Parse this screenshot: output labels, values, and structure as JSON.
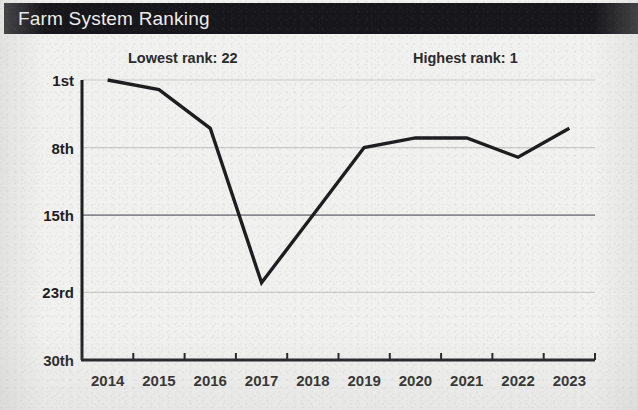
{
  "header": {
    "title": "Farm System Ranking",
    "bar_color": "#17161a",
    "title_color": "#f0efee"
  },
  "annotations": {
    "lowest": "Lowest rank: 22",
    "highest": "Highest rank: 1"
  },
  "chart_data": {
    "type": "line",
    "title": "Farm System Ranking",
    "xlabel": "",
    "ylabel": "",
    "x": [
      "2014",
      "2015",
      "2016",
      "2017",
      "2018",
      "2019",
      "2020",
      "2021",
      "2022",
      "2023"
    ],
    "categories": [
      "2014",
      "2015",
      "2016",
      "2017",
      "2018",
      "2019",
      "2020",
      "2021",
      "2022",
      "2023"
    ],
    "values": [
      1,
      2,
      6,
      22,
      15,
      8,
      7,
      7,
      9,
      6
    ],
    "series": [
      {
        "name": "Farm system rank",
        "values": [
          1,
          2,
          6,
          22,
          15,
          8,
          7,
          7,
          9,
          6
        ],
        "color": "#1d1d1f"
      }
    ],
    "y_ticks": [
      1,
      8,
      15,
      23,
      30
    ],
    "y_tick_labels": [
      "1st",
      "8th",
      "15th",
      "23rd",
      "30th"
    ],
    "ylim": [
      1,
      30
    ],
    "y_inverted": true,
    "grid": true,
    "emphasized_gridline": 15,
    "legend": "none",
    "annotations": [
      {
        "text": "Lowest rank: 22",
        "position": "top-left"
      },
      {
        "text": "Highest rank: 1",
        "position": "top-right"
      }
    ],
    "line_color": "#1d1d1f",
    "background_color": "#f1f1f0",
    "gridline_color": "#c9c9c9",
    "emphasized_gridline_color": "#8a8a8e"
  }
}
